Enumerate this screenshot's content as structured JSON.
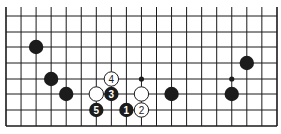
{
  "board": {
    "origin_x": 6,
    "spacing_x": 15.05,
    "rows_y": [
      16,
      32,
      47,
      63,
      79,
      94,
      110
    ],
    "bottom_y": 126,
    "top_y": 7,
    "right_x": 277,
    "columns": 19,
    "stone_radius": 7.2,
    "colors": {
      "black": "#1c1c1c",
      "white": "#ffffff",
      "line": "#1a1a1a"
    }
  },
  "stones": [
    {
      "color": "black",
      "col": 2,
      "row": 2,
      "label": ""
    },
    {
      "color": "black",
      "col": 3,
      "row": 4,
      "label": ""
    },
    {
      "color": "black",
      "col": 4,
      "row": 5,
      "label": ""
    },
    {
      "color": "white",
      "col": 7,
      "row": 4,
      "label": "4"
    },
    {
      "color": "white",
      "col": 6,
      "row": 5,
      "label": ""
    },
    {
      "color": "black",
      "col": 7,
      "row": 5,
      "label": "3"
    },
    {
      "color": "black",
      "col": 6,
      "row": 6,
      "label": "5"
    },
    {
      "color": "black",
      "col": 8,
      "row": 6,
      "label": "1"
    },
    {
      "color": "white",
      "col": 9,
      "row": 6,
      "label": "2"
    },
    {
      "color": "white",
      "col": 9,
      "row": 5,
      "label": ""
    },
    {
      "color": "black",
      "col": 11,
      "row": 5,
      "label": ""
    },
    {
      "color": "black",
      "col": 15,
      "row": 5,
      "label": ""
    },
    {
      "color": "black",
      "col": 16,
      "row": 3,
      "label": ""
    }
  ],
  "markers": [
    {
      "type": "dot",
      "col": 9,
      "row": 4
    },
    {
      "type": "dot",
      "col": 15,
      "row": 4
    }
  ]
}
